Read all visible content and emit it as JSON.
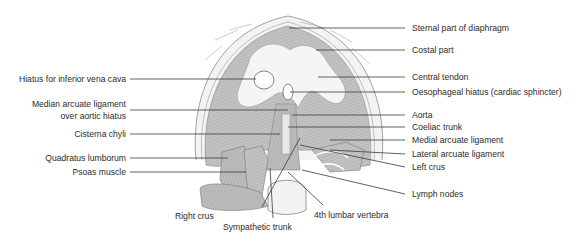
{
  "figure": {
    "colors": {
      "muscle": "#bdbdbd",
      "muscle_dark": "#9e9e9e",
      "tendon": "#f4f4f4",
      "outline": "#7a7a7a",
      "leader_line": "#3a3a3a",
      "text": "#2b2b2b",
      "background": "#ffffff"
    }
  },
  "labels": {
    "left": [
      {
        "id": "ivc-hiatus",
        "text": "Hiatus for inferior vena cava"
      },
      {
        "id": "median-arcuate-1",
        "text": "Median arcuate ligament"
      },
      {
        "id": "median-arcuate-2",
        "text": "over aortic hiatus"
      },
      {
        "id": "cisterna-chyli",
        "text": "Cisterna chyli"
      },
      {
        "id": "quadratus-lumborum",
        "text": "Quadratus lumborum"
      },
      {
        "id": "psoas",
        "text": "Psoas muscle"
      }
    ],
    "right": [
      {
        "id": "sternal-part",
        "text": "Sternal part of diaphragm"
      },
      {
        "id": "costal-part",
        "text": "Costal part"
      },
      {
        "id": "central-tendon",
        "text": "Central tendon"
      },
      {
        "id": "oesophageal-hiatus",
        "text": "Oesophageal hiatus (cardiac sphincter)"
      },
      {
        "id": "aorta",
        "text": "Aorta"
      },
      {
        "id": "coeliac-trunk",
        "text": "Coeliac trunk"
      },
      {
        "id": "medial-arcuate",
        "text": "Medial arcuate ligament"
      },
      {
        "id": "lateral-arcuate",
        "text": "Lateral arcuate ligament"
      },
      {
        "id": "left-crus",
        "text": "Left crus"
      },
      {
        "id": "lymph-nodes",
        "text": "Lymph nodes"
      }
    ],
    "bottom": [
      {
        "id": "right-crus",
        "text": "Right crus"
      },
      {
        "id": "sympathetic-trunk",
        "text": "Sympathetic trunk"
      },
      {
        "id": "lumbar-vertebra",
        "text": "4th lumbar vertebra"
      }
    ]
  }
}
